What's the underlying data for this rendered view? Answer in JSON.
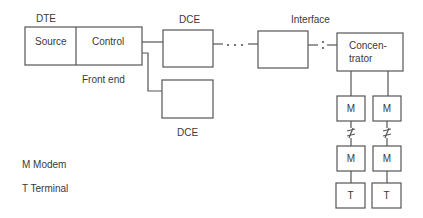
{
  "labels": {
    "dte": "DTE",
    "source": "Source",
    "control": "Control",
    "front_end": "Front end",
    "dce_top": "DCE",
    "dce_bottom": "DCE",
    "interface": "Interface",
    "concentrator_line1": "Concen-",
    "concentrator_line2": "trator",
    "modem_left_1": "M",
    "modem_right_1": "M",
    "modem_left_2": "M",
    "modem_right_2": "M",
    "terminal_left": "T",
    "terminal_right": "T"
  },
  "legend": {
    "modem": "M Modem",
    "terminal": "T Terminal"
  },
  "connectors": {
    "dots_dce_interface": "· · ·",
    "colon_interface_concentrator": ":",
    "break_symbol": "≠"
  },
  "colors": {
    "line": "#555555",
    "text": "#3a3a3a",
    "background": "#ffffff"
  }
}
